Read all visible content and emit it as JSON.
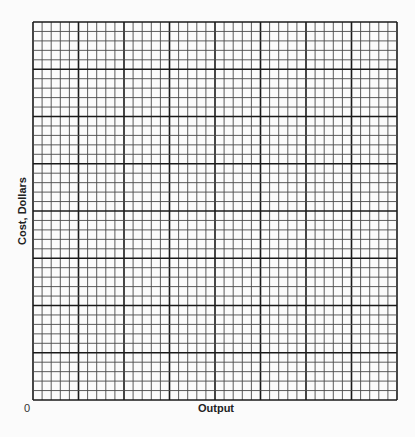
{
  "chart_data": {
    "type": "line",
    "title": "",
    "xlabel": "Output",
    "ylabel": "Cost, Dollars",
    "origin_label": "0",
    "series": [],
    "grid": {
      "on": true,
      "major_columns": 8,
      "major_rows": 8,
      "minor_per_major": 5
    },
    "colors": {
      "major_line": "#1a1a1a",
      "minor_line": "#4a4a4a",
      "background": "#fbfbfb"
    }
  }
}
